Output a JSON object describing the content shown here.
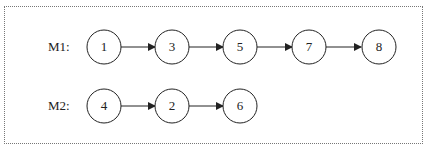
{
  "diagram": {
    "rows": [
      {
        "label": "M1:",
        "nodes": [
          "1",
          "3",
          "5",
          "7",
          "8"
        ]
      },
      {
        "label": "M2:",
        "nodes": [
          "4",
          "2",
          "6"
        ]
      }
    ],
    "colors": {
      "stroke": "#222222",
      "border": "#777777",
      "background": "#ffffff"
    }
  }
}
